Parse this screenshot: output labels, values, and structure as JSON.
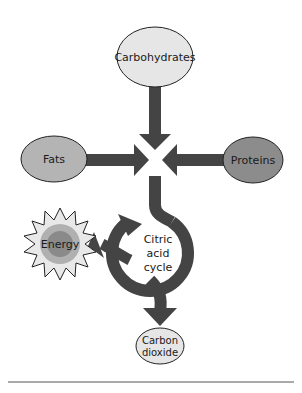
{
  "diagram": {
    "type": "metabolic-flow",
    "nodes": {
      "carbohydrates": {
        "label": "Carbohydrates",
        "fill": "#e6e6e6"
      },
      "fats": {
        "label": "Fats",
        "fill": "#b4b4b4"
      },
      "proteins": {
        "label": "Proteins",
        "fill": "#8c8c8c"
      },
      "energy": {
        "label": "Energy",
        "fill_outer": "#e8e8e8",
        "fill_inner": "#8a8a8a"
      },
      "citric_acid_cycle": {
        "line1": "Citric",
        "line2": "acid",
        "line3": "cycle"
      },
      "carbon_dioxide": {
        "line1": "Carbon",
        "line2": "dioxide",
        "fill": "#e6e6e6"
      }
    },
    "edges": [
      {
        "from": "carbohydrates",
        "to": "junction"
      },
      {
        "from": "fats",
        "to": "junction"
      },
      {
        "from": "proteins",
        "to": "junction"
      },
      {
        "from": "junction",
        "to": "citric_acid_cycle"
      },
      {
        "from": "citric_acid_cycle",
        "to": "energy"
      },
      {
        "from": "citric_acid_cycle",
        "to": "carbon_dioxide"
      }
    ],
    "colors": {
      "arrow": "#444444",
      "outline": "#222222",
      "rule": "#555555"
    }
  }
}
